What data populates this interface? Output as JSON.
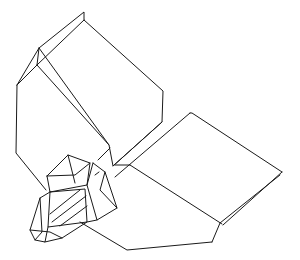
{
  "figure": {
    "background": "#ffffff",
    "stroke_color": "#1a1a1a",
    "stroke_width": 1,
    "polylines": {
      "upper_crystal_outline": "17,85 39,48 84,12 84,20 163,91 162,122 113,166 109,145 39,48",
      "upper_crystal_left_strip": "39,48 37,65 17,85",
      "upper_crystal_top_edge": "37,65 84,20",
      "upper_crystal_left_side": "17,85 16,153 46,190",
      "upper_crystal_front_edge": "37,65 109,145",
      "joint_strip_upper": "113,166 162,122",
      "joint_strip_lower": "115,177 190,113",
      "joint_strip_inner": "98,160 110,148",
      "right_crystal_top_edge": "190,113 192,113 282,172",
      "right_crystal_rim": "280,175 220,223 212,242",
      "right_crystal_rim_outer": "282,172 223,225",
      "right_crystal_fold": "130,165 222,224",
      "right_crystal_bottom": "212,242 127,250 80,222",
      "right_crystal_near_edge": "115,165 130,165",
      "cluster_top_hex": "47,176 68,155 90,163 87,185 50,192 47,176",
      "cluster_top_inner_a": "68,155 75,183",
      "cluster_top_inner_b": "47,176 75,175 90,163",
      "cluster_right_block": "93,163 105,172 117,208 97,220 87,185 93,163",
      "cluster_right_inner": "105,172 100,190 117,208",
      "cluster_mid_block": "50,192 85,189 87,222 48,227 50,192",
      "cluster_mid_hatch_1": "50,214 80,190",
      "cluster_mid_hatch_2": "52,222 86,196",
      "cluster_mid_hatch_3": "60,226 87,206",
      "cluster_left_face": "50,192 40,198 30,230 35,240 45,242 48,227",
      "cluster_left_inner": "40,198 42,232 35,240",
      "cluster_bottom_facets": "45,242 62,238 87,222 97,220",
      "cluster_bottom_facets_2": "30,230 50,232 62,238",
      "cluster_joint_marks": "95,175 99,172"
    }
  }
}
